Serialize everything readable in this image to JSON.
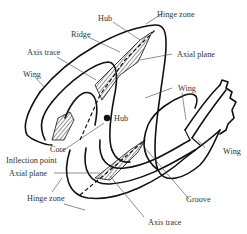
{
  "figure": {
    "type": "fold-anatomy-diagram",
    "labels": {
      "hub_top": "Hub",
      "hinge_zone_top": "Hinge zone",
      "ridge": "Ridge",
      "axial_plane_right": "Axial plane",
      "axis_trace_top": "Axis trace",
      "wing_left": "Wing",
      "wing_middle": "Wing",
      "hub_center": "Hub",
      "wing_right": "Wing",
      "core": "Core",
      "inflection_point": "Inflection point",
      "axial_plane_left": "Axial plane",
      "hinge_zone_bottom": "Hinge zone",
      "groove": "Groove",
      "axis_trace_bottom": "Axis trace"
    }
  },
  "colors": {
    "line": "#111111",
    "text": "#333333",
    "background": "#ffffff"
  }
}
